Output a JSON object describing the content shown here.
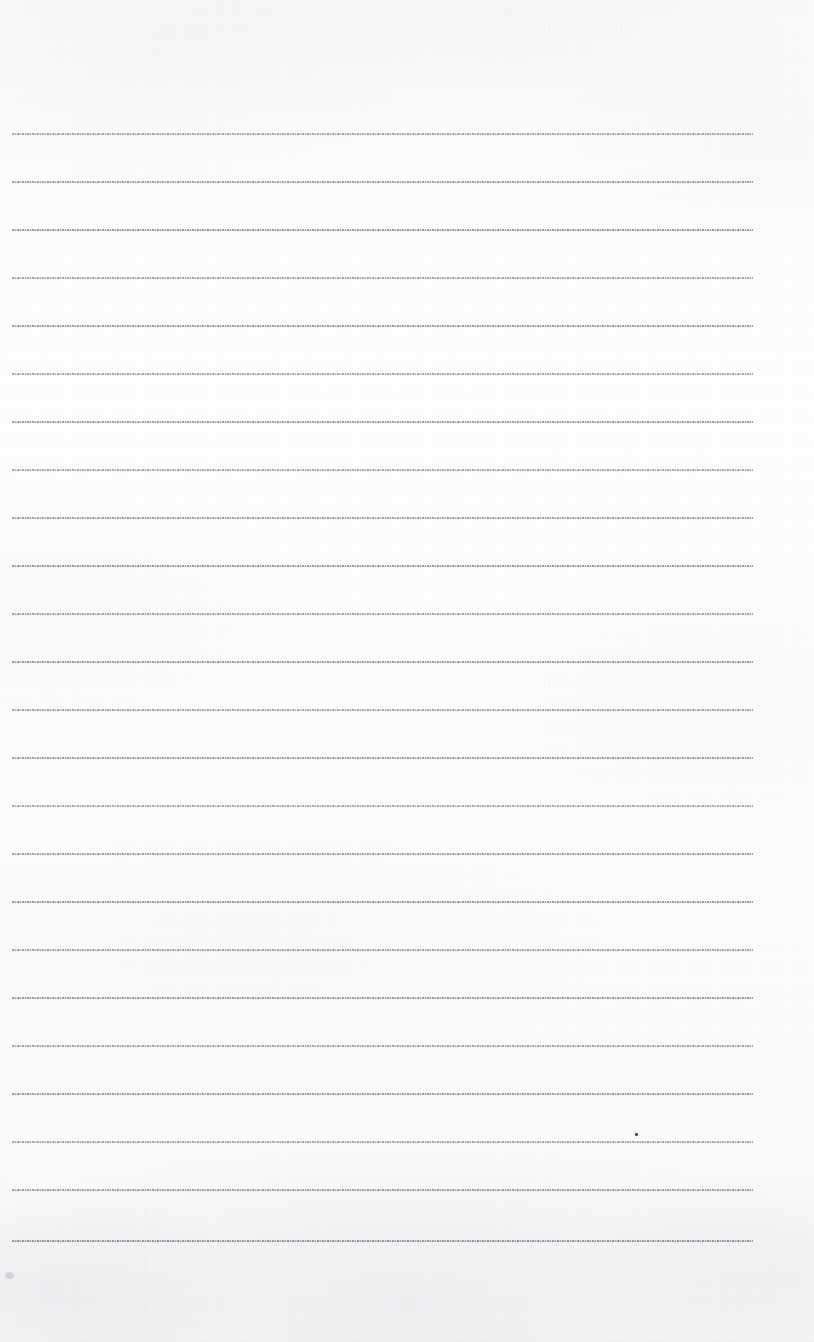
{
  "document": {
    "kind": "scanned-ruled-notebook-page",
    "title": "",
    "body_text": "",
    "is_blank": true,
    "page_width": 814,
    "page_height": 1342
  },
  "paper": {
    "background_color": "#fdfdfd",
    "shadow_color": "#f4f4f6",
    "texture": "vertical-scan-banding"
  },
  "ruling": {
    "line_color": "#80828c",
    "line_style": "dotted-dashed",
    "line_thickness_px": 2,
    "line_left_x": 12,
    "line_right_x": 753,
    "first_line_y": 133,
    "line_spacing_px": 48.2,
    "line_count": 24,
    "line_y_positions": [
      133,
      181,
      229,
      277,
      325,
      373,
      421,
      469,
      517,
      565,
      613,
      661,
      709,
      757,
      805,
      853,
      901,
      949,
      997,
      1045,
      1093,
      1141,
      1189,
      1240
    ]
  },
  "artifacts": {
    "ink_speck": {
      "x": 635,
      "y": 1133,
      "width": 3,
      "height": 3,
      "color": "#4c4c52"
    },
    "corner_smudge": {
      "x": 5,
      "y": 1272,
      "width": 9,
      "height": 7
    }
  },
  "margins": {
    "top_blank_height": 133,
    "bottom_blank_height": 102,
    "right_blank_width": 61,
    "left_blank_width": 12
  }
}
